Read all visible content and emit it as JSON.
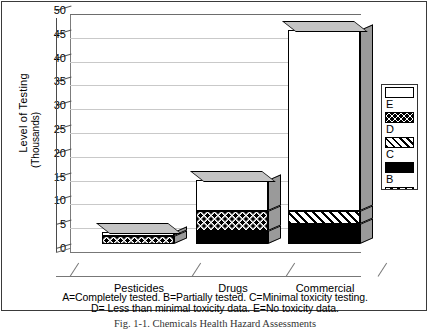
{
  "chart_data": {
    "type": "bar",
    "stacked": true,
    "projection": "3d",
    "title": "Fig. 1-1. Chemicals Health Hazard Assessments",
    "xlabel": "",
    "ylabel": "Level of Testing",
    "ylabel2": "(Thousands)",
    "ylim": [
      0,
      50
    ],
    "yticks": [
      0,
      5,
      10,
      15,
      20,
      25,
      30,
      35,
      40,
      45,
      50
    ],
    "grid": true,
    "legend_position": "right",
    "categories": [
      "Pesticides",
      "Drugs",
      "Commercial"
    ],
    "series": [
      {
        "name": "B",
        "label": "B",
        "pattern": "black",
        "values": [
          0.0,
          2.8,
          4.2
        ]
      },
      {
        "name": "D",
        "label": "D",
        "pattern": "checker",
        "values": [
          1.6,
          4.2,
          0.0
        ]
      },
      {
        "name": "C",
        "label": "C",
        "pattern": "diag",
        "values": [
          0.0,
          0.0,
          2.8
        ]
      },
      {
        "name": "E",
        "label": "E",
        "pattern": "white",
        "values": [
          0.9,
          6.5,
          38.0
        ]
      }
    ],
    "totals": [
      2.5,
      13.5,
      45.0
    ],
    "legend_entries": [
      {
        "label": "E",
        "pattern": "white"
      },
      {
        "label": "D",
        "pattern": "checker"
      },
      {
        "label": "C",
        "pattern": "diag"
      },
      {
        "label": "B",
        "pattern": "black"
      },
      {
        "label": "A",
        "pattern": "hatch"
      }
    ],
    "annotations": [
      "A=Completely tested.  B=Partially tested.  C=Minimal toxicity testing.",
      "D= Less than minimal toxicity data.  E=No toxicity data."
    ]
  },
  "colors": {
    "axis": "#4a4a4a",
    "grid": "#c9c9c9",
    "frame": "#3a3a3a",
    "bar_side": "#9a9a9a",
    "bar_top": "#c9c9c9",
    "background": "#ffffff"
  }
}
